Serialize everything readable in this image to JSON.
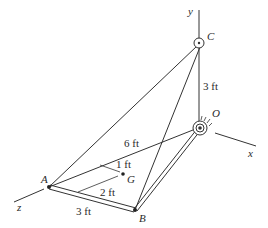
{
  "diagram": {
    "axes": {
      "x": "x",
      "y": "y",
      "z": "z"
    },
    "points": {
      "A": "A",
      "B": "B",
      "C": "C",
      "O": "O",
      "G": "G"
    },
    "dimensions": {
      "OC": "3 ft",
      "AO": "6 ft",
      "AB": "3 ft",
      "G_offset_1": "1 ft",
      "G_offset_2": "2 ft"
    },
    "colors": {
      "line": "#333333",
      "background": "#ffffff"
    }
  }
}
